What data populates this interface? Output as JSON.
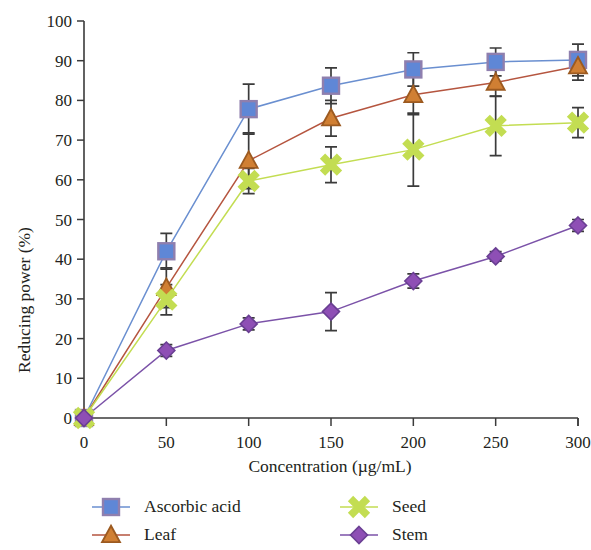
{
  "chart_data": {
    "type": "line",
    "title": "",
    "xlabel": "Concentration (µg/mL)",
    "ylabel": "Reducing power (%)",
    "x": [
      0,
      50,
      100,
      150,
      200,
      250,
      300
    ],
    "xlim": [
      0,
      300
    ],
    "ylim": [
      0,
      100
    ],
    "xticks": [
      0,
      50,
      100,
      150,
      200,
      250,
      300
    ],
    "yticks": [
      0,
      10,
      20,
      30,
      40,
      50,
      60,
      70,
      80,
      90,
      100
    ],
    "xtick_labels": [
      "0",
      "50",
      "100",
      "150",
      "200",
      "250",
      "300"
    ],
    "ytick_labels": [
      "0",
      "10",
      "20",
      "30",
      "40",
      "50",
      "60",
      "70",
      "80",
      "90",
      "100"
    ],
    "grid": false,
    "legend_position": "below-axes",
    "error_bars": true,
    "series": [
      {
        "name": "Ascorbic acid",
        "color": "#6a8fd0",
        "marker": "square",
        "marker_fill": "#5f87d6",
        "marker_edge": "#8f7fae",
        "values": [
          0,
          42.0,
          77.8,
          83.7,
          87.8,
          89.7,
          90.2
        ],
        "errors": [
          0,
          4.5,
          6.3,
          4.5,
          4.2,
          3.5,
          4.0
        ]
      },
      {
        "name": "Leaf",
        "color": "#b5553f",
        "marker": "triangle",
        "marker_fill": "#d07f33",
        "marker_edge": "#9c5a20",
        "values": [
          0,
          32.8,
          64.8,
          75.5,
          81.4,
          84.5,
          88.6
        ],
        "errors": [
          0,
          5.0,
          7.0,
          4.5,
          5.0,
          3.5,
          3.5
        ]
      },
      {
        "name": "Seed",
        "color": "#c3dd52",
        "marker": "cross",
        "marker_fill": "#c3dd52",
        "marker_edge": "#a9c63b",
        "values": [
          0,
          29.8,
          59.7,
          63.8,
          67.6,
          73.6,
          74.4
        ],
        "errors": [
          0,
          3.8,
          3.2,
          4.5,
          9.2,
          7.5,
          3.8
        ]
      },
      {
        "name": "Stem",
        "color": "#7b52a8",
        "marker": "diamond",
        "marker_fill": "#8e4fb5",
        "marker_edge": "#6a3f93",
        "values": [
          0,
          17.0,
          23.7,
          26.8,
          34.5,
          40.7,
          48.5
        ],
        "errors": [
          0,
          1.5,
          1.5,
          4.8,
          1.8,
          1.2,
          1.5
        ]
      }
    ]
  },
  "legend": {
    "entries": [
      {
        "label": "Ascorbic acid"
      },
      {
        "label": "Seed"
      },
      {
        "label": "Leaf"
      },
      {
        "label": "Stem"
      }
    ]
  }
}
